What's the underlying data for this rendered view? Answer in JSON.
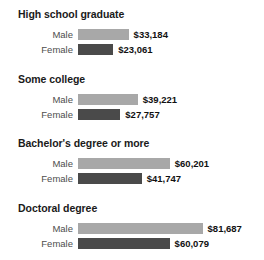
{
  "chart_data": {
    "type": "bar",
    "title": "",
    "subtitle": "",
    "xlabel": "",
    "ylabel": "",
    "orientation": "horizontal",
    "grid": false,
    "legend": "none",
    "xlim": [
      0,
      81687
    ],
    "categories": [
      "High school graduate",
      "Some college",
      "Bachelor's degree or more",
      "Doctoral degree"
    ],
    "series": [
      {
        "name": "Male",
        "color": "#a8a8a8",
        "values": [
          33184,
          39221,
          60201,
          81687
        ],
        "labels": [
          "$33,184",
          "$39,221",
          "$60,201",
          "$81,687"
        ]
      },
      {
        "name": "Female",
        "color": "#4a4a4a",
        "values": [
          23061,
          27757,
          41747,
          60079
        ],
        "labels": [
          "$23,061",
          "$27,757",
          "$41,747",
          "$60,079"
        ]
      }
    ]
  },
  "groups": [
    {
      "title": "High school graduate",
      "rows": [
        {
          "label": "Male",
          "value": 33184,
          "value_label": "$33,184",
          "series": "male"
        },
        {
          "label": "Female",
          "value": 23061,
          "value_label": "$23,061",
          "series": "female"
        }
      ]
    },
    {
      "title": "Some college",
      "rows": [
        {
          "label": "Male",
          "value": 39221,
          "value_label": "$39,221",
          "series": "male"
        },
        {
          "label": "Female",
          "value": 27757,
          "value_label": "$27,757",
          "series": "female"
        }
      ]
    },
    {
      "title": "Bachelor's degree or more",
      "rows": [
        {
          "label": "Male",
          "value": 60201,
          "value_label": "$60,201",
          "series": "male"
        },
        {
          "label": "Female",
          "value": 41747,
          "value_label": "$41,747",
          "series": "female"
        }
      ]
    },
    {
      "title": "Doctoral degree",
      "rows": [
        {
          "label": "Male",
          "value": 81687,
          "value_label": "$81,687",
          "series": "male"
        },
        {
          "label": "Female",
          "value": 60079,
          "value_label": "$60,079",
          "series": "female"
        }
      ]
    }
  ],
  "colors": {
    "male_bar": "#a8a8a8",
    "female_bar": "#4a4a4a",
    "title_text": "#1a1a1a",
    "label_text": "#4d4d4d",
    "value_text": "#111111",
    "background": "#ffffff"
  },
  "layout": {
    "bar_origin_x": 78,
    "px_per_dollar": 0.001525,
    "group_tops": [
      8,
      73,
      137,
      202
    ],
    "row_offsets": [
      20,
      35
    ],
    "bar_height": 11,
    "value_gap": 5
  }
}
